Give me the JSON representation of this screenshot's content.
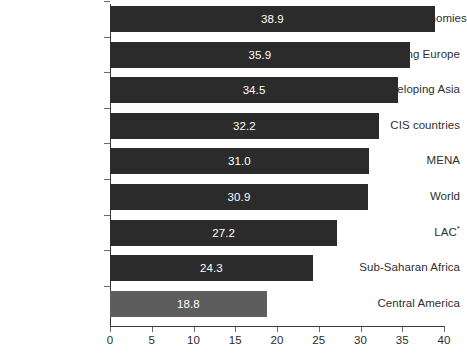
{
  "chart_data": {
    "type": "bar",
    "orientation": "horizontal",
    "title": "",
    "subtitle": "",
    "xlabel": "",
    "ylabel": "",
    "xlim": [
      0,
      40
    ],
    "xticks": [
      0,
      5,
      10,
      15,
      20,
      25,
      30,
      35,
      40
    ],
    "xtick_labels": [
      "0",
      "5",
      "10",
      "15",
      "20",
      "25",
      "30",
      "35",
      "40"
    ],
    "grid": false,
    "legend": null,
    "categories": [
      "Advanced economies",
      "Emerging Europe",
      "Developing Asia",
      "CIS countries",
      "MENA",
      "World",
      "LAC*",
      "Sub-Saharan Africa",
      "Central America"
    ],
    "values": [
      38.9,
      35.9,
      34.5,
      32.2,
      31.0,
      30.9,
      27.2,
      24.3,
      18.8
    ],
    "value_labels": [
      "38.9",
      "35.9",
      "34.5",
      "32.2",
      "31.0",
      "30.9",
      "27.2",
      "24.3",
      "18.8"
    ],
    "bars": [
      {
        "category": "Advanced economies",
        "value": 38.9,
        "label": "38.9",
        "highlight": false,
        "footnote": ""
      },
      {
        "category": "Emerging Europe",
        "value": 35.9,
        "label": "35.9",
        "highlight": false,
        "footnote": ""
      },
      {
        "category": "Developing Asia",
        "value": 34.5,
        "label": "34.5",
        "highlight": false,
        "footnote": ""
      },
      {
        "category": "CIS countries",
        "value": 32.2,
        "label": "32.2",
        "highlight": false,
        "footnote": ""
      },
      {
        "category": "MENA",
        "value": 31.0,
        "label": "31.0",
        "highlight": false,
        "footnote": ""
      },
      {
        "category": "World",
        "value": 30.9,
        "label": "30.9",
        "highlight": false,
        "footnote": ""
      },
      {
        "category": "LAC",
        "value": 27.2,
        "label": "27.2",
        "highlight": false,
        "footnote": "*"
      },
      {
        "category": "Sub-Saharan Africa",
        "value": 24.3,
        "label": "24.3",
        "highlight": false,
        "footnote": ""
      },
      {
        "category": "Central America",
        "value": 18.8,
        "label": "18.8",
        "highlight": true,
        "footnote": ""
      }
    ],
    "colors": {
      "bar": "#2b2b2b",
      "bar_highlight": "#5d5d5d",
      "value_label": "#ffffff",
      "axis": "#3a3a3a",
      "tick": "#6a6a6a",
      "text": "#2f2f2f",
      "background": "#ffffff"
    }
  }
}
